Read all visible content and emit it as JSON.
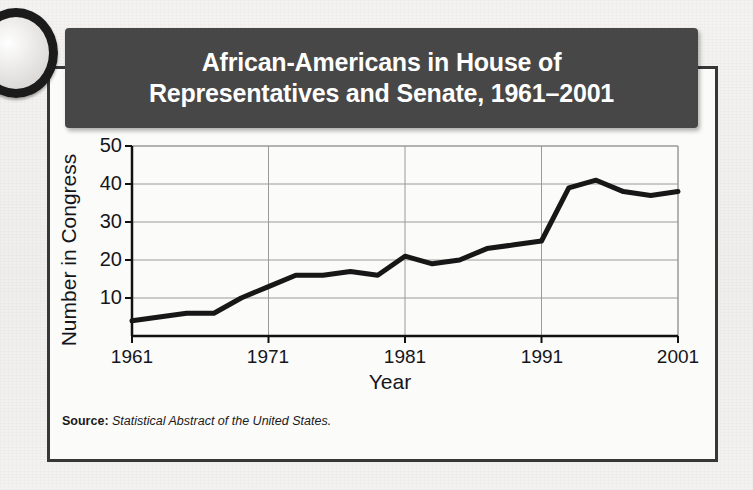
{
  "figure": {
    "title": "African-Americans in House of\nRepresentatives and Senate, 1961–2001",
    "source_label": "Source:",
    "source_text": "Statistical Abstract of the United States.",
    "banner_color": "#474747",
    "card_border_color": "#373737",
    "line_color": "#171717",
    "grid_color": "#9a9a9a"
  },
  "chart_data": {
    "type": "line",
    "title": "African-Americans in House of Representatives and Senate, 1961–2001",
    "xlabel": "Year",
    "ylabel": "Number in Congress",
    "xlim": [
      1961,
      2001
    ],
    "ylim": [
      0,
      50
    ],
    "grid": true,
    "legend": null,
    "xticks": [
      1961,
      1971,
      1981,
      1991,
      2001
    ],
    "yticks": [
      10,
      20,
      30,
      40,
      50
    ],
    "x": [
      1961,
      1963,
      1965,
      1967,
      1969,
      1971,
      1973,
      1975,
      1977,
      1979,
      1981,
      1983,
      1985,
      1987,
      1989,
      1991,
      1993,
      1995,
      1997,
      1999,
      2001
    ],
    "values": [
      4,
      5,
      6,
      6,
      10,
      13,
      16,
      16,
      17,
      16,
      21,
      19,
      20,
      23,
      24,
      25,
      39,
      41,
      38,
      37,
      38
    ],
    "series": [
      {
        "name": "African-Americans in Congress",
        "values": [
          4,
          5,
          6,
          6,
          10,
          13,
          16,
          16,
          17,
          16,
          21,
          19,
          20,
          23,
          24,
          25,
          39,
          41,
          38,
          37,
          38
        ]
      }
    ]
  },
  "axes": {
    "y_tick_labels": [
      "50",
      "40",
      "30",
      "20",
      "10"
    ],
    "x_tick_labels": [
      "1961",
      "1971",
      "1981",
      "1991",
      "2001"
    ],
    "y_title": "Number in Congress",
    "x_title": "Year"
  }
}
